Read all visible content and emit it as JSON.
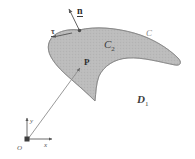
{
  "figure": {
    "background_color": "#ffffff",
    "region_fill_color": "#b9b9b9",
    "region_stroke_color": "#7a7a7a",
    "line_color": "#6f6f6f",
    "text_color": "#333333",
    "labels": {
      "normal_vector": "n",
      "tangent_vector": "τ",
      "inner_region": "C",
      "inner_region_subscript": "2",
      "boundary_curve": "C",
      "outer_region": "D",
      "outer_region_subscript": "1",
      "point": "P",
      "axis_x": "x",
      "axis_y": "y",
      "origin": "O"
    }
  }
}
